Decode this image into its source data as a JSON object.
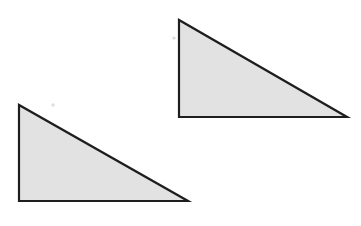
{
  "figure": {
    "width": 361,
    "height": 226,
    "background_color": "#ffffff",
    "stroke_color": "#1e1e1e",
    "fill_color": "#e2e2e2",
    "stroke_width": 2.2,
    "shapes": [
      {
        "id": "triangle-upper-right",
        "name": "upper-right-triangle",
        "type": "right-triangle",
        "points": "179,20 179,117 347,117",
        "vertices": [
          {
            "label": "apex",
            "x": 179,
            "y": 20
          },
          {
            "label": "right-angle",
            "x": 179,
            "y": 117
          },
          {
            "label": "base-right",
            "x": 347,
            "y": 117
          }
        ],
        "vertical_leg_length": 97,
        "horizontal_leg_length": 168,
        "fill": "#e2e2e2",
        "stroke": "#1e1e1e"
      },
      {
        "id": "triangle-lower-left",
        "name": "lower-left-triangle",
        "type": "right-triangle",
        "points": "19,105 19,201 188,201",
        "vertices": [
          {
            "label": "apex",
            "x": 19,
            "y": 105
          },
          {
            "label": "right-angle",
            "x": 19,
            "y": 201
          },
          {
            "label": "base-right",
            "x": 188,
            "y": 201
          }
        ],
        "vertical_leg_length": 96,
        "horizontal_leg_length": 169,
        "fill": "#e2e2e2",
        "stroke": "#1e1e1e"
      }
    ],
    "specks": [
      {
        "id": "speck-upper",
        "x": 174,
        "y": 38,
        "r": 1.6,
        "color": "#b8b8b8"
      },
      {
        "id": "speck-lower",
        "x": 53,
        "y": 105,
        "r": 1.8,
        "color": "#c2c2c2"
      }
    ]
  }
}
